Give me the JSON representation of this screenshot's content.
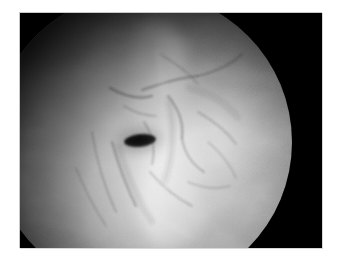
{
  "image": {
    "kind": "photograph",
    "subject": "endoscopic-view",
    "color_mode": "grayscale",
    "page_background": "#ffffff",
    "frame": {
      "background": "#000000",
      "x": 20,
      "y": 13,
      "width": 302,
      "height": 235
    },
    "field_of_view": {
      "shape": "circle",
      "center_x": 142,
      "center_y": 142,
      "radius": 150,
      "bright_center": "#d9d9d9",
      "dark_edge": "#040404"
    },
    "features": {
      "lumen_opening": {
        "shape": "ellipse",
        "center_x": 140,
        "center_y": 140,
        "width": 32,
        "height": 13,
        "rotation_deg": -6,
        "fill": "#0b0b0b"
      },
      "bright_fold": {
        "orientation": "vertical",
        "center_x": 171,
        "description": "specular mucosal ridge"
      },
      "illumination": "upper-left dark, lower-right bright"
    }
  },
  "canvas": {
    "width": 341,
    "height": 264
  }
}
